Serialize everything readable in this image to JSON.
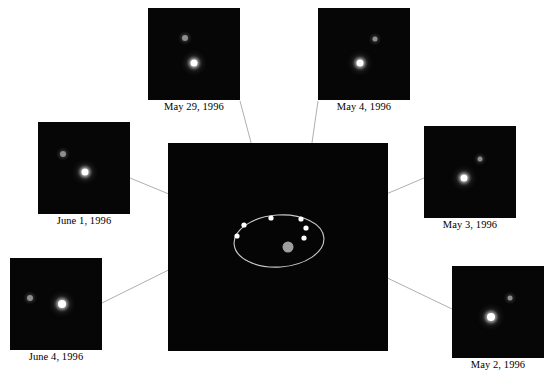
{
  "figure": {
    "background": "#ffffff",
    "sky_color": "#060606",
    "line_color": "#9a9a9a",
    "orbit_color": "#c8c8c8",
    "marker_color": "#ffffff",
    "primary_color": "#ffffff",
    "secondary_color": "#8e8e8e",
    "central_body_color": "#9e9e9e"
  },
  "orbit_panel": {
    "x": 168,
    "y": 143,
    "width": 220,
    "height": 208,
    "ellipse": {
      "cx": 279,
      "cy": 241,
      "rx": 45,
      "ry": 26,
      "rotation": -4
    },
    "central_body": {
      "cx": 288,
      "cy": 247,
      "r": 5.5
    },
    "markers": [
      {
        "name": "marker-may-29",
        "cx": 271,
        "cy": 218
      },
      {
        "name": "marker-may-4",
        "cx": 301,
        "cy": 219
      },
      {
        "name": "marker-june-1",
        "cx": 244,
        "cy": 225
      },
      {
        "name": "marker-may-3",
        "cx": 306,
        "cy": 228
      },
      {
        "name": "marker-june-4",
        "cx": 237,
        "cy": 236
      },
      {
        "name": "marker-may-2",
        "cx": 304,
        "cy": 238
      }
    ]
  },
  "observations": [
    {
      "id": "may-29-1996",
      "label": "May 29, 1996",
      "panel": {
        "x": 148,
        "y": 8,
        "width": 92,
        "height": 92
      },
      "caption_y": 101,
      "primary": {
        "x": 46,
        "y": 55,
        "d": 7
      },
      "secondary": {
        "x": 37,
        "y": 30,
        "d": 6
      }
    },
    {
      "id": "may-4-1996",
      "label": "May 4, 1996",
      "panel": {
        "x": 318,
        "y": 8,
        "width": 92,
        "height": 92
      },
      "caption_y": 101,
      "primary": {
        "x": 42,
        "y": 55,
        "d": 7
      },
      "secondary": {
        "x": 57,
        "y": 31,
        "d": 5
      }
    },
    {
      "id": "june-1-1996",
      "label": "June 1, 1996",
      "panel": {
        "x": 38,
        "y": 122,
        "width": 92,
        "height": 92
      },
      "caption_y": 215,
      "primary": {
        "x": 47,
        "y": 50,
        "d": 7
      },
      "secondary": {
        "x": 25,
        "y": 32,
        "d": 6
      }
    },
    {
      "id": "may-3-1996",
      "label": "May 3, 1996",
      "panel": {
        "x": 424,
        "y": 126,
        "width": 92,
        "height": 92
      },
      "caption_y": 219,
      "primary": {
        "x": 40,
        "y": 52,
        "d": 7
      },
      "secondary": {
        "x": 56,
        "y": 33,
        "d": 5
      }
    },
    {
      "id": "june-4-1996",
      "label": "June 4, 1996",
      "panel": {
        "x": 10,
        "y": 258,
        "width": 92,
        "height": 92
      },
      "caption_y": 351,
      "primary": {
        "x": 52,
        "y": 46,
        "d": 8
      },
      "secondary": {
        "x": 20,
        "y": 40,
        "d": 6
      }
    },
    {
      "id": "may-2-1996",
      "label": "May 2, 1996",
      "panel": {
        "x": 452,
        "y": 266,
        "width": 92,
        "height": 92
      },
      "caption_y": 359,
      "primary": {
        "x": 39,
        "y": 51,
        "d": 8
      },
      "secondary": {
        "x": 58,
        "y": 32,
        "d": 5
      }
    }
  ],
  "leader_lines": [
    {
      "name": "leader-may-29",
      "x1": 240,
      "y1": 101,
      "x2": 271,
      "y2": 218
    },
    {
      "name": "leader-may-4",
      "x1": 318,
      "y1": 101,
      "x2": 301,
      "y2": 219
    },
    {
      "name": "leader-june-1",
      "x1": 130,
      "y1": 178,
      "x2": 244,
      "y2": 225
    },
    {
      "name": "leader-may-3",
      "x1": 424,
      "y1": 178,
      "x2": 306,
      "y2": 228
    },
    {
      "name": "leader-june-4",
      "x1": 102,
      "y1": 303,
      "x2": 237,
      "y2": 236
    },
    {
      "name": "leader-may-2",
      "x1": 452,
      "y1": 309,
      "x2": 304,
      "y2": 238
    }
  ]
}
